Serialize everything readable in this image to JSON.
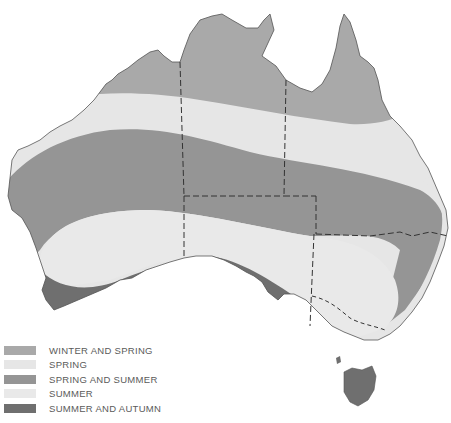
{
  "map": {
    "subject": "Australia",
    "description": "Seasonal zones map of Australia with state borders",
    "zones": [
      {
        "name": "winter-and-spring",
        "label": "WINTER AND SPRING",
        "color": "#a9a9a9"
      },
      {
        "name": "spring",
        "label": "SPRING",
        "color": "#e6e6e6"
      },
      {
        "name": "spring-and-summer",
        "label": "SPRING AND SUMMER",
        "color": "#959595"
      },
      {
        "name": "summer",
        "label": "SUMMER",
        "color": "#e9e9e9"
      },
      {
        "name": "summer-and-autumn",
        "label": "SUMMER AND AUTUMN",
        "color": "#6f6f6f"
      }
    ]
  },
  "legend": {
    "items": [
      {
        "label": "WINTER AND SPRING",
        "color": "#a9a9a9"
      },
      {
        "label": "SPRING",
        "color": "#e6e6e6"
      },
      {
        "label": "SPRING AND SUMMER",
        "color": "#959595"
      },
      {
        "label": "SUMMER",
        "color": "#e9e9e9"
      },
      {
        "label": "SUMMER AND AUTUMN",
        "color": "#6f6f6f"
      }
    ]
  }
}
